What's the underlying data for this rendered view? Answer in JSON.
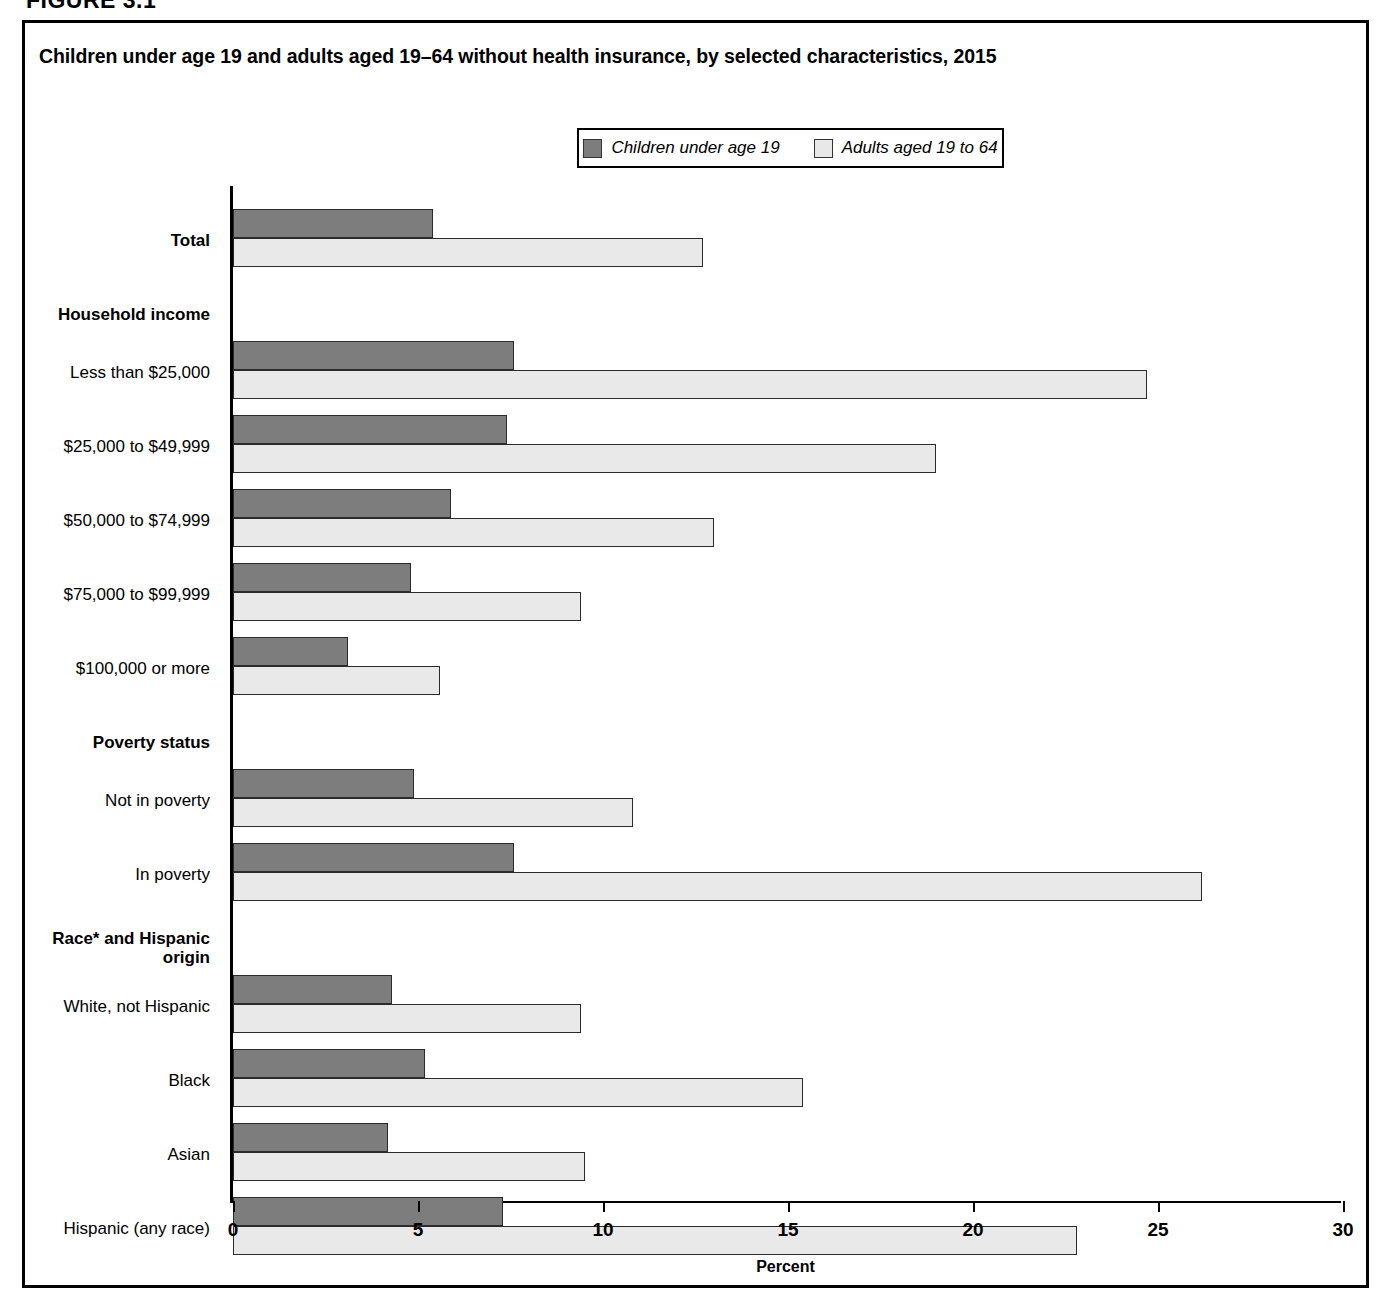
{
  "figure_number": "FIGURE 3.1",
  "chart_title": "Children under age 19 and adults aged 19–64 without health insurance, by selected characteristics, 2015",
  "legend": {
    "entries": [
      {
        "label": "Children under age 19",
        "color": "#7d7d7d",
        "swatch": "children-swatch"
      },
      {
        "label": "Adults aged 19 to 64",
        "color": "#e8e8e8",
        "swatch": "adults-swatch"
      }
    ]
  },
  "axis": {
    "x_title": "Percent",
    "x_ticks": [
      "0",
      "5",
      "10",
      "15",
      "20",
      "25",
      "30"
    ],
    "x_min": 0,
    "x_max": 30
  },
  "chart_data": {
    "type": "bar",
    "orientation": "horizontal",
    "title": "Children under age 19 and adults aged 19–64 without health insurance, by selected characteristics, 2015",
    "xlabel": "Percent",
    "ylabel": "",
    "xlim": [
      0,
      30
    ],
    "grid": false,
    "legend_position": "top-center",
    "series": [
      {
        "name": "Children under age 19",
        "color": "#7d7d7d"
      },
      {
        "name": "Adults aged 19 to 64",
        "color": "#e9e9e9"
      }
    ],
    "rows": [
      {
        "label": "Total",
        "type": "data",
        "bold": true,
        "children": 5.4,
        "adults": 12.7
      },
      {
        "label": "Household income",
        "type": "group",
        "bold": true
      },
      {
        "label": "Less than $25,000",
        "type": "data",
        "children": 7.6,
        "adults": 24.7
      },
      {
        "label": "$25,000 to $49,999",
        "type": "data",
        "children": 7.4,
        "adults": 19.0
      },
      {
        "label": "$50,000 to $74,999",
        "type": "data",
        "children": 5.9,
        "adults": 13.0
      },
      {
        "label": "$75,000 to $99,999",
        "type": "data",
        "children": 4.8,
        "adults": 9.4
      },
      {
        "label": "$100,000 or more",
        "type": "data",
        "children": 3.1,
        "adults": 5.6
      },
      {
        "label": "Poverty status",
        "type": "group",
        "bold": true
      },
      {
        "label": "Not in poverty",
        "type": "data",
        "children": 4.9,
        "adults": 10.8
      },
      {
        "label": "In poverty",
        "type": "data",
        "children": 7.6,
        "adults": 26.2
      },
      {
        "label": "Race* and Hispanic\norigin",
        "type": "group",
        "bold": true
      },
      {
        "label": "White, not Hispanic",
        "type": "data",
        "children": 4.3,
        "adults": 9.4
      },
      {
        "label": "Black",
        "type": "data",
        "children": 5.2,
        "adults": 15.4
      },
      {
        "label": "Asian",
        "type": "data",
        "children": 4.2,
        "adults": 9.5
      },
      {
        "label": "Hispanic (any race)",
        "type": "data",
        "children": 7.3,
        "adults": 22.8
      },
      {
        "label": "Nativity",
        "type": "group",
        "bold": true
      },
      {
        "label": "Native-born citizen",
        "type": "data",
        "children": 4.9,
        "adults": 10.8
      },
      {
        "label": "Naturalized citizen",
        "type": "data",
        "children": 6.8,
        "adults": 11.0
      },
      {
        "label": "Noncitizen",
        "type": "data",
        "children": 17.4,
        "adults": 28.9
      }
    ]
  }
}
